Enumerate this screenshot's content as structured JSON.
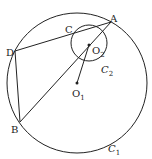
{
  "diagram": {
    "type": "geometry",
    "circles": [
      {
        "name": "C1",
        "cx": 77,
        "cy": 83,
        "r": 70
      },
      {
        "name": "C2",
        "cx": 89,
        "cy": 43,
        "r": 18
      }
    ],
    "points": {
      "A": {
        "x": 111,
        "y": 22
      },
      "B": {
        "x": 20,
        "y": 122
      },
      "C": {
        "x": 76,
        "y": 32
      },
      "D": {
        "x": 15,
        "y": 51
      },
      "O1": {
        "x": 77,
        "y": 83
      },
      "O2": {
        "x": 89,
        "y": 45
      }
    },
    "labels": {
      "A": "A",
      "B": "B",
      "C": "C",
      "D": "D",
      "O1_main": "O",
      "O1_sub": "1",
      "O2_main": "O",
      "O2_sub": "2",
      "C1_main": "C",
      "C1_sub": "1",
      "C2_main": "C",
      "C2_sub": "2"
    },
    "segments": [
      "DA",
      "DB",
      "BA",
      "O1O2"
    ],
    "stroke_color": "#222222"
  }
}
